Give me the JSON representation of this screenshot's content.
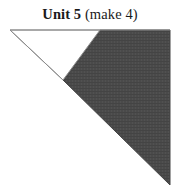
{
  "figure": {
    "title": {
      "unit_label": "Unit 5",
      "count_label": "(make 4)",
      "separator": " "
    },
    "background_color": "#ffffff",
    "text_color": "#1a1a1a"
  },
  "diagram": {
    "type": "quilt-block-unit",
    "canvas": {
      "width": 180,
      "height": 196
    },
    "outline_color": "#8c8c8c",
    "outline_width": 1,
    "shapes": [
      {
        "name": "white-triangle",
        "fill": "#ffffff",
        "stroke": "#8c8c8c",
        "points": "10,30 100,30 63,80"
      },
      {
        "name": "dark-triangle",
        "fill": "#4a4a4a",
        "stroke": "#4a4a4a",
        "points": "100,30 170,30 170,185 63,80"
      }
    ],
    "edges": [
      {
        "name": "top-edge",
        "from": "10,30",
        "to": "170,30"
      },
      {
        "name": "white-hypotenuse",
        "from": "10,30",
        "to": "63,80"
      },
      {
        "name": "internal-seam",
        "from": "63,80",
        "to": "100,30"
      },
      {
        "name": "long-hypotenuse",
        "from": "63,80",
        "to": "170,185"
      },
      {
        "name": "right-edge",
        "from": "170,30",
        "to": "170,185"
      }
    ]
  }
}
